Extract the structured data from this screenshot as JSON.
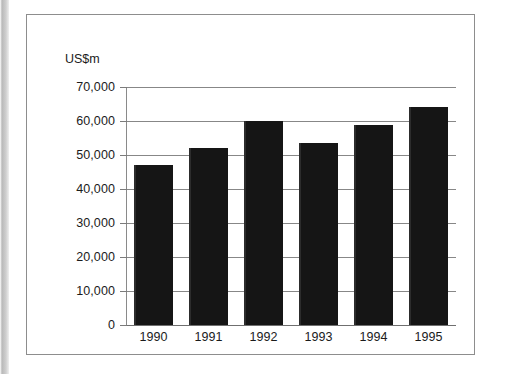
{
  "figure": {
    "unit_label": "US$m"
  },
  "chart_data": {
    "type": "bar",
    "title": "",
    "subtitle": "",
    "xlabel": "",
    "ylabel": "US$m",
    "categories": [
      "1990",
      "1991",
      "1992",
      "1993",
      "1994",
      "1995"
    ],
    "values": [
      47000,
      52000,
      60000,
      53500,
      58800,
      64000
    ],
    "ylim": [
      0,
      70000
    ],
    "ytick_labels": [
      "70,000",
      "60,000",
      "50,000",
      "40,000",
      "30,000",
      "20,000",
      "10,000",
      "0"
    ],
    "ytick_values": [
      70000,
      60000,
      50000,
      40000,
      30000,
      20000,
      10000,
      0
    ],
    "grid": true,
    "legend": "none",
    "bar_color": "#151515",
    "gridline_color": "#878787",
    "axis_color": "#8a8a8a",
    "text_color": "#1b1b1b"
  }
}
